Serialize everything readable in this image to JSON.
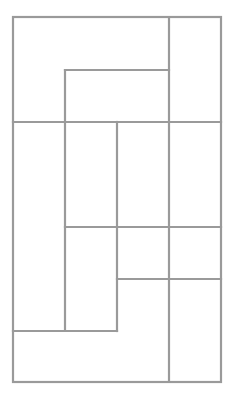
{
  "diagram": {
    "type": "rectangle-dissection",
    "stroke_color": "#9a9a9a",
    "background": "#ffffff",
    "outer_box": {
      "x1": 13,
      "y1": 17,
      "x2": 221,
      "y2": 382
    },
    "segments": [
      {
        "id": "v-169-full",
        "x1": 169,
        "y1": 17,
        "x2": 169,
        "y2": 382
      },
      {
        "id": "h-70",
        "x1": 65,
        "y1": 70,
        "x2": 169,
        "y2": 70
      },
      {
        "id": "v-65",
        "x1": 65,
        "y1": 70,
        "x2": 65,
        "y2": 331
      },
      {
        "id": "h-122-full",
        "x1": 13,
        "y1": 122,
        "x2": 221,
        "y2": 122
      },
      {
        "id": "v-117",
        "x1": 117,
        "y1": 122,
        "x2": 117,
        "y2": 331
      },
      {
        "id": "h-227",
        "x1": 65,
        "y1": 227,
        "x2": 221,
        "y2": 227
      },
      {
        "id": "h-279",
        "x1": 117,
        "y1": 279,
        "x2": 221,
        "y2": 279
      },
      {
        "id": "h-331",
        "x1": 13,
        "y1": 331,
        "x2": 117,
        "y2": 331
      }
    ]
  }
}
